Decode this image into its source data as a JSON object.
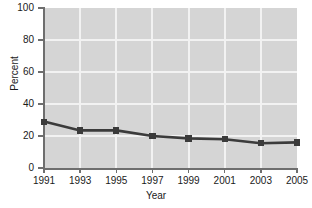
{
  "chart_data": {
    "type": "line",
    "title": "",
    "subtitle": "",
    "xlabel": "Year",
    "ylabel": "Percent",
    "categories": [
      "1991",
      "1993",
      "1995",
      "1997",
      "1999",
      "2001",
      "2003",
      "2005"
    ],
    "x": [
      1991,
      1993,
      1995,
      1997,
      1999,
      2001,
      2003,
      2005
    ],
    "values": [
      29,
      23.5,
      23.5,
      20,
      18.5,
      18,
      15.5,
      16
    ],
    "series": [
      {
        "name": "Percent",
        "values": [
          29,
          23.5,
          23.5,
          20,
          18.5,
          18,
          15.5,
          16
        ]
      }
    ],
    "xlim": [
      1991,
      2005
    ],
    "ylim": [
      0,
      100
    ],
    "ytick_labels": [
      "0",
      "20",
      "40",
      "60",
      "80",
      "100"
    ],
    "yticks": [
      0,
      20,
      40,
      60,
      80,
      100
    ],
    "xtick_labels": [
      "1991",
      "1993",
      "1995",
      "1997",
      "1999",
      "2001",
      "2003",
      "2005"
    ],
    "grid": true,
    "grid_axis": "both",
    "legend": false,
    "legend_position": "none",
    "marker": "square",
    "annotations": []
  },
  "style": {
    "plot_background": "#d5d5d5",
    "figure_background": "#ffffff",
    "gridline_color": "#f2f2f2",
    "series_color": "#3b3b3b",
    "axis_color": "#6e6e6e",
    "text_color": "#1a1a1a"
  }
}
